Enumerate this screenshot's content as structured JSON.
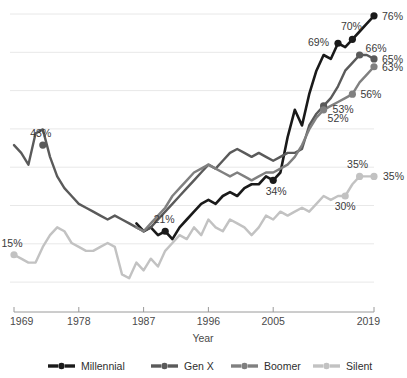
{
  "chart_data": {
    "type": "line",
    "title": "",
    "xlabel": "Year",
    "ylabel": "",
    "xlim": [
      1969,
      2019
    ],
    "ylim": [
      6,
      78
    ],
    "grid": true,
    "legend_position": "bottom",
    "x_tick_labels": [
      "1969",
      "1978",
      "1987",
      "1996",
      "2005",
      "2019"
    ],
    "x_ticks": [
      1969,
      1978,
      1987,
      1996,
      2005,
      2019
    ],
    "series": [
      {
        "name": "Millennial",
        "color": "#1a1a1a",
        "x": [
          1986,
          1987,
          1988,
          1989,
          1990,
          1991,
          1992,
          1993,
          1994,
          1995,
          1996,
          1997,
          1998,
          1999,
          2000,
          2001,
          2002,
          2003,
          2004,
          2005,
          2006,
          2007,
          2008,
          2009,
          2010,
          2011,
          2012,
          2013,
          2014,
          2015,
          2016,
          2017,
          2018,
          2019
        ],
        "y": [
          23,
          21,
          22,
          20,
          21,
          19,
          22,
          24,
          26,
          28,
          29,
          28,
          30,
          31,
          30,
          32,
          33,
          33,
          35,
          34,
          36,
          45,
          52,
          48,
          56,
          62,
          66,
          65,
          69,
          68,
          70,
          72,
          74,
          76
        ],
        "labeled_points": [
          {
            "x": 1990,
            "y": 21,
            "label": "21%"
          },
          {
            "x": 2005,
            "y": 34,
            "label": "34%"
          },
          {
            "x": 2014,
            "y": 69,
            "label": "69%"
          },
          {
            "x": 2016,
            "y": 70,
            "label": "70%"
          },
          {
            "x": 2019,
            "y": 76,
            "label": "76%"
          }
        ]
      },
      {
        "name": "Gen X",
        "color": "#5a5a5a",
        "x": [
          1969,
          1970,
          1971,
          1972,
          1973,
          1974,
          1975,
          1976,
          1977,
          1978,
          1979,
          1980,
          1981,
          1982,
          1983,
          1984,
          1985,
          1986,
          1987,
          1988,
          1989,
          1990,
          1991,
          1992,
          1993,
          1994,
          1995,
          1996,
          1997,
          1998,
          1999,
          2000,
          2001,
          2002,
          2003,
          2004,
          2005,
          2006,
          2007,
          2008,
          2009,
          2010,
          2011,
          2012,
          2013,
          2014,
          2015,
          2016,
          2017,
          2018,
          2019
        ],
        "y": [
          43,
          41,
          38,
          46,
          47,
          40,
          35,
          32,
          30,
          28,
          27,
          26,
          25,
          24,
          25,
          24,
          23,
          22,
          21,
          22,
          24,
          26,
          28,
          30,
          32,
          34,
          36,
          38,
          37,
          39,
          41,
          42,
          41,
          40,
          41,
          40,
          39,
          40,
          41,
          41,
          42,
          48,
          51,
          53,
          55,
          58,
          62,
          64,
          66,
          66,
          65
        ],
        "labeled_points": [
          {
            "x": 1973,
            "y": 43,
            "label": "43%"
          },
          {
            "x": 2012,
            "y": 53,
            "label": "53%"
          },
          {
            "x": 2017,
            "y": 66,
            "label": "66%"
          },
          {
            "x": 2019,
            "y": 65,
            "label": "65%"
          }
        ]
      },
      {
        "name": "Boomer",
        "color": "#808080",
        "x": [
          1986,
          1987,
          1988,
          1989,
          1990,
          1991,
          1992,
          1993,
          1994,
          1995,
          1996,
          1997,
          1998,
          1999,
          2000,
          2001,
          2002,
          2003,
          2004,
          2005,
          2006,
          2007,
          2008,
          2009,
          2010,
          2011,
          2012,
          2013,
          2014,
          2015,
          2016,
          2017,
          2018,
          2019
        ],
        "y": [
          22,
          21,
          23,
          25,
          27,
          30,
          32,
          34,
          36,
          37,
          38,
          37,
          36,
          35,
          36,
          35,
          34,
          35,
          36,
          36,
          37,
          38,
          40,
          43,
          47,
          50,
          52,
          53,
          54,
          55,
          56,
          59,
          61,
          63
        ],
        "labeled_points": [
          {
            "x": 2012,
            "y": 52,
            "label": "52%"
          },
          {
            "x": 2016,
            "y": 56,
            "label": "56%"
          },
          {
            "x": 2019,
            "y": 63,
            "label": "63%"
          }
        ]
      },
      {
        "name": "Silent",
        "color": "#c2c2c2",
        "x": [
          1969,
          1970,
          1971,
          1972,
          1973,
          1974,
          1975,
          1976,
          1977,
          1978,
          1979,
          1980,
          1981,
          1982,
          1983,
          1984,
          1985,
          1986,
          1987,
          1988,
          1989,
          1990,
          1991,
          1992,
          1993,
          1994,
          1995,
          1996,
          1997,
          1998,
          1999,
          2000,
          2001,
          2002,
          2003,
          2004,
          2005,
          2006,
          2007,
          2008,
          2009,
          2010,
          2011,
          2012,
          2013,
          2014,
          2015,
          2016,
          2017,
          2018,
          2019
        ],
        "y": [
          15,
          14,
          13,
          13,
          17,
          20,
          22,
          21,
          18,
          17,
          16,
          16,
          17,
          18,
          17,
          10,
          9,
          13,
          11,
          14,
          12,
          16,
          18,
          20,
          19,
          22,
          20,
          24,
          22,
          21,
          24,
          23,
          22,
          20,
          22,
          25,
          24,
          26,
          25,
          26,
          27,
          26,
          28,
          30,
          29,
          30,
          30,
          33,
          35,
          35,
          35
        ],
        "labeled_points": [
          {
            "x": 1969,
            "y": 15,
            "label": "15%"
          },
          {
            "x": 2015,
            "y": 30,
            "label": "30%"
          },
          {
            "x": 2017,
            "y": 35,
            "label": "35%"
          },
          {
            "x": 2019,
            "y": 35,
            "label": "35%"
          }
        ]
      }
    ]
  },
  "legend": {
    "items": [
      {
        "label": "Millennial",
        "color": "#1a1a1a"
      },
      {
        "label": "Gen X",
        "color": "#5a5a5a"
      },
      {
        "label": "Boomer",
        "color": "#808080"
      },
      {
        "label": "Silent",
        "color": "#c2c2c2"
      }
    ]
  },
  "axis": {
    "x_title": "Year"
  }
}
